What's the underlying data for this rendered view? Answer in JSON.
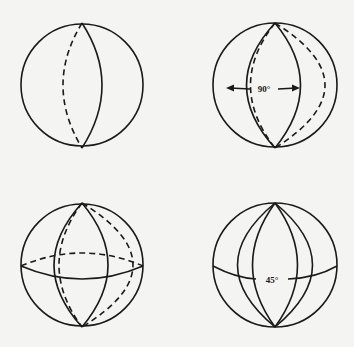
{
  "figure": {
    "panels": [
      {
        "id": "top-left",
        "description": "Sphere with one solid and one dashed meridian (a great circle seen obliquely)"
      },
      {
        "id": "top-right",
        "description": "Sphere with two great circles intersecting at poles; angle between them marked",
        "angle_label": "90°"
      },
      {
        "id": "bottom-left",
        "description": "Sphere with meridians and equator; back halves dashed"
      },
      {
        "id": "bottom-right",
        "description": "Sphere with several meridians and equator; angle label between meridians",
        "angle_label": "45°"
      }
    ]
  },
  "colors": {
    "background": "#f4f4f2",
    "ink": "#1a1a1a"
  }
}
